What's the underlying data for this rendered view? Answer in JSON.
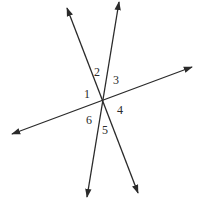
{
  "diagram": {
    "type": "three intersecting lines",
    "intersection": {
      "x": 102,
      "y": 101
    },
    "stroke_color": "#2a2a2a",
    "lines": [
      {
        "name": "line-a",
        "from": {
          "x": 67,
          "y": 8
        },
        "to": {
          "x": 138,
          "y": 193
        }
      },
      {
        "name": "line-b",
        "from": {
          "x": 119,
          "y": 2
        },
        "to": {
          "x": 87,
          "y": 197
        }
      },
      {
        "name": "line-c",
        "from": {
          "x": 12,
          "y": 134
        },
        "to": {
          "x": 192,
          "y": 67
        }
      }
    ],
    "angle_labels": [
      {
        "text": "1",
        "x": 84,
        "y": 88
      },
      {
        "text": "2",
        "x": 94,
        "y": 66
      },
      {
        "text": "3",
        "x": 113,
        "y": 74
      },
      {
        "text": "4",
        "x": 117,
        "y": 104
      },
      {
        "text": "5",
        "x": 102,
        "y": 124
      },
      {
        "text": "6",
        "x": 86,
        "y": 114
      }
    ]
  }
}
